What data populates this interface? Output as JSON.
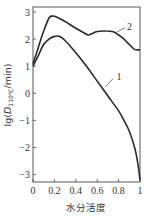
{
  "chart_data": {
    "type": "line",
    "title": "",
    "xlabel": "水分活度",
    "ylabel": "lg(D110℃/min)",
    "ylabel_parts": {
      "pre": "lg(",
      "D": "D",
      "sub": "110℃",
      "post": "/min)"
    },
    "xlim": [
      0,
      1
    ],
    "ylim": [
      -3.2,
      3.2
    ],
    "xticks": [
      0,
      0.2,
      0.4,
      0.6,
      0.8,
      1
    ],
    "xtick_labels": [
      "0",
      "0.2",
      "0.4",
      "0.6",
      "0.8",
      "1"
    ],
    "yticks": [
      3,
      2,
      1,
      0,
      -1,
      -2,
      -3
    ],
    "ytick_labels": [
      "3",
      "2",
      "1",
      "0",
      "−1",
      "−2",
      "−3"
    ],
    "grid": false,
    "legend": "inline labels",
    "series": [
      {
        "name": "1",
        "x": [
          0,
          0.05,
          0.1,
          0.15,
          0.2,
          0.25,
          0.3,
          0.4,
          0.5,
          0.6,
          0.7,
          0.8,
          0.85,
          0.9,
          0.95,
          0.98,
          1.0
        ],
        "y": [
          1.0,
          1.4,
          1.8,
          2.0,
          2.1,
          2.1,
          1.95,
          1.5,
          1.0,
          0.45,
          -0.1,
          -0.65,
          -1.0,
          -1.4,
          -2.0,
          -2.6,
          -3.2
        ]
      },
      {
        "name": "2",
        "x": [
          0,
          0.05,
          0.1,
          0.15,
          0.18,
          0.22,
          0.3,
          0.4,
          0.5,
          0.52,
          0.55,
          0.6,
          0.68,
          0.75,
          0.8,
          0.85,
          0.9,
          0.95,
          1.0
        ],
        "y": [
          1.1,
          1.7,
          2.3,
          2.78,
          2.85,
          2.82,
          2.65,
          2.4,
          2.18,
          2.15,
          2.2,
          2.28,
          2.3,
          2.27,
          2.15,
          2.0,
          1.8,
          1.62,
          1.6
        ]
      }
    ],
    "annotations": [
      {
        "text": "1",
        "x": 0.77,
        "y": 0.6
      },
      {
        "text": "2",
        "x": 0.87,
        "y": 2.45
      }
    ]
  }
}
